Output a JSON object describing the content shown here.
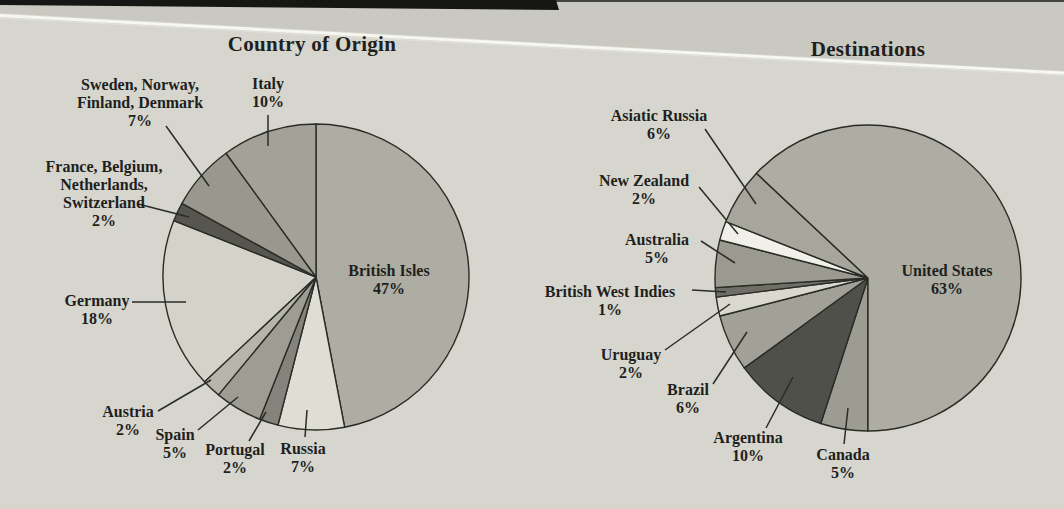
{
  "figure": {
    "text_color": "#1f1f1d",
    "page_background": "#d6d6ce",
    "page_background_above_crease": "#c9c9c1",
    "outline_color": "#2b2b27"
  },
  "chart_data": [
    {
      "type": "pie",
      "title": "Country of Origin",
      "legend_position": "none",
      "grid": false,
      "start_angle_deg": 0,
      "direction": "clockwise",
      "slices": [
        {
          "label": "British Isles",
          "name_lines": [
            "British Isles"
          ],
          "pct": 47,
          "pct_label": "47%",
          "color": "#adada3"
        },
        {
          "label": "Russia",
          "name_lines": [
            "Russia"
          ],
          "pct": 7,
          "pct_label": "7%",
          "color": "#deded4"
        },
        {
          "label": "Portugal",
          "name_lines": [
            "Portugal"
          ],
          "pct": 2,
          "pct_label": "2%",
          "color": "#84847c"
        },
        {
          "label": "Spain",
          "name_lines": [
            "Spain"
          ],
          "pct": 5,
          "pct_label": "5%",
          "color": "#9d9d93"
        },
        {
          "label": "Austria",
          "name_lines": [
            "Austria"
          ],
          "pct": 2,
          "pct_label": "2%",
          "color": "#b5b5ab"
        },
        {
          "label": "Germany",
          "name_lines": [
            "Germany"
          ],
          "pct": 18,
          "pct_label": "18%",
          "color": "#d3d3c9"
        },
        {
          "label": "France, Belgium, Netherlands, Switzerland",
          "name_lines": [
            "France, Belgium,",
            "Netherlands,",
            "Switzerland"
          ],
          "pct": 2,
          "pct_label": "2%",
          "color": "#56564f"
        },
        {
          "label": "Sweden, Norway, Finland, Denmark",
          "name_lines": [
            "Sweden, Norway,",
            "Finland, Denmark"
          ],
          "pct": 7,
          "pct_label": "7%",
          "color": "#98988e"
        },
        {
          "label": "Italy",
          "name_lines": [
            "Italy"
          ],
          "pct": 10,
          "pct_label": "10%",
          "color": "#a2a298"
        }
      ]
    },
    {
      "type": "pie",
      "title": "Destinations",
      "legend_position": "none",
      "grid": false,
      "start_angle_deg": 180,
      "direction": "clockwise",
      "slices": [
        {
          "label": "Canada",
          "name_lines": [
            "Canada"
          ],
          "pct": 5,
          "pct_label": "5%",
          "color": "#9c9c92"
        },
        {
          "label": "Argentina",
          "name_lines": [
            "Argentina"
          ],
          "pct": 10,
          "pct_label": "10%",
          "color": "#50504a"
        },
        {
          "label": "Brazil",
          "name_lines": [
            "Brazil"
          ],
          "pct": 6,
          "pct_label": "6%",
          "color": "#a1a197"
        },
        {
          "label": "Uruguay",
          "name_lines": [
            "Uruguay"
          ],
          "pct": 2,
          "pct_label": "2%",
          "color": "#d9d9cf"
        },
        {
          "label": "British West Indies",
          "name_lines": [
            "British West Indies"
          ],
          "pct": 1,
          "pct_label": "1%",
          "color": "#6e6e66"
        },
        {
          "label": "Australia",
          "name_lines": [
            "Australia"
          ],
          "pct": 5,
          "pct_label": "5%",
          "color": "#9a9a90"
        },
        {
          "label": "New Zealand",
          "name_lines": [
            "New Zealand"
          ],
          "pct": 2,
          "pct_label": "2%",
          "color": "#f0f0e8"
        },
        {
          "label": "Asiatic Russia",
          "name_lines": [
            "Asiatic Russia"
          ],
          "pct": 6,
          "pct_label": "6%",
          "color": "#a6a69c"
        },
        {
          "label": "United States",
          "name_lines": [
            "United States"
          ],
          "pct": 63,
          "pct_label": "63%",
          "color": "#adada3"
        }
      ]
    }
  ]
}
